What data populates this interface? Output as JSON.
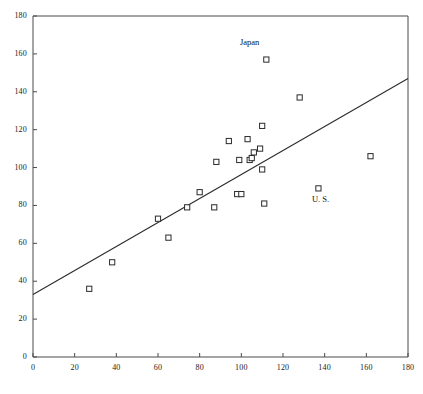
{
  "chart_data": {
    "type": "scatter",
    "title": "",
    "subtitle": "",
    "xlabel": "",
    "ylabel": "",
    "xlim": [
      0,
      180
    ],
    "ylim": [
      0,
      180
    ],
    "xticks": [
      0,
      20,
      40,
      60,
      80,
      100,
      120,
      140,
      160,
      180
    ],
    "yticks": [
      0,
      20,
      40,
      60,
      80,
      100,
      120,
      140,
      160,
      180
    ],
    "grid": false,
    "legend": null,
    "marker": "open-square",
    "series": [
      {
        "name": "countries",
        "points": [
          {
            "x": 27,
            "y": 36
          },
          {
            "x": 38,
            "y": 50
          },
          {
            "x": 60,
            "y": 73
          },
          {
            "x": 65,
            "y": 63
          },
          {
            "x": 74,
            "y": 79
          },
          {
            "x": 80,
            "y": 87
          },
          {
            "x": 87,
            "y": 79
          },
          {
            "x": 88,
            "y": 103
          },
          {
            "x": 94,
            "y": 114
          },
          {
            "x": 98,
            "y": 86
          },
          {
            "x": 100,
            "y": 86
          },
          {
            "x": 99,
            "y": 104
          },
          {
            "x": 103,
            "y": 115
          },
          {
            "x": 104,
            "y": 104
          },
          {
            "x": 105,
            "y": 105
          },
          {
            "x": 106,
            "y": 108
          },
          {
            "x": 109,
            "y": 110
          },
          {
            "x": 110,
            "y": 122
          },
          {
            "x": 110,
            "y": 99
          },
          {
            "x": 111,
            "y": 81
          },
          {
            "x": 112,
            "y": 157
          },
          {
            "x": 128,
            "y": 137
          },
          {
            "x": 137,
            "y": 89
          },
          {
            "x": 162,
            "y": 106
          }
        ]
      }
    ],
    "trendline": {
      "type": "linear",
      "x_start": 0,
      "y_start": 33,
      "x_end": 180,
      "y_end": 147
    },
    "annotations": [
      {
        "text": "Japan",
        "x": 104,
        "y": 166,
        "anchor": "middle",
        "target_point": {
          "x": 112,
          "y": 157
        }
      },
      {
        "text": "U. S.",
        "x": 138,
        "y": 83,
        "anchor": "middle",
        "target_point": {
          "x": 137,
          "y": 89
        }
      }
    ]
  },
  "axes": {
    "x_tick_labels": [
      "0",
      "20",
      "40",
      "60",
      "80",
      "100",
      "120",
      "140",
      "160",
      "180"
    ],
    "y_tick_labels": [
      "0",
      "20",
      "40",
      "60",
      "80",
      "100",
      "120",
      "140",
      "160",
      "180"
    ]
  }
}
